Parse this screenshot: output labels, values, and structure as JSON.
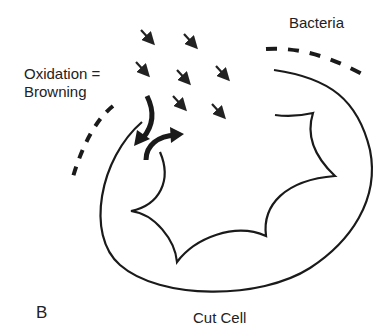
{
  "diagram": {
    "panel_label": "B",
    "labels": {
      "oxidation_line1": "Oxidation =",
      "oxidation_line2": "Browning",
      "bacteria": "Bacteria",
      "cut_cell": "Cut Cell"
    },
    "elements": {
      "small_arrows_count": 7,
      "small_arrow_direction": "down-right (oxygen entering)",
      "thick_arrows": [
        "inward arrow into cell",
        "outward arrow from cell"
      ],
      "dashed_barriers": [
        "left barrier (oxidation)",
        "right barrier (bacteria)"
      ],
      "shapes": [
        "outer cell wall",
        "inner cut cavity"
      ]
    },
    "colors": {
      "stroke": "#222222",
      "background": "#ffffff"
    }
  }
}
